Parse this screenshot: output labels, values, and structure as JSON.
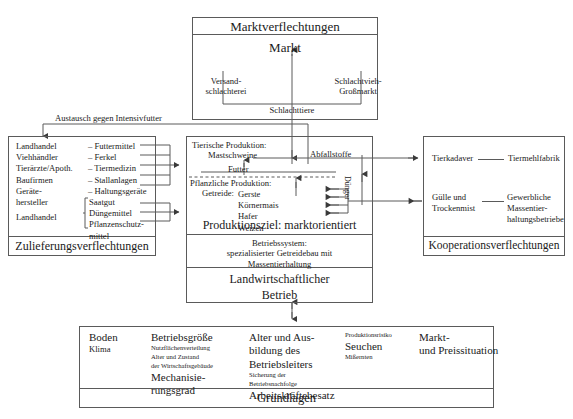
{
  "diagram": {
    "title_hidden": "Agrarbetrieb Verflechtungsdiagramm"
  },
  "market_panel": {
    "caption": "Marktverflechtungen",
    "center_label": "Markt",
    "left_node": "Versand-\nschlachterei",
    "left_node_line1": "Versand-",
    "left_node_line2": "schlachterei",
    "right_node_line1": "Schlachtvieh-",
    "right_node_line2": "Großmarkt",
    "flow_label": "Schlachttiere"
  },
  "supply_panel": {
    "caption": "Zulieferungsverflechtungen",
    "group_a": {
      "actors": [
        "Landhandel",
        "Viehhändler",
        "Tierärzte/Apoth.",
        "Baufirmen",
        "Geräte-",
        "hersteller"
      ],
      "goods": [
        "– Futtermittel",
        "– Ferkel",
        "– Tiermedizin",
        "– Stallanlagen",
        "– Haltungsgeräte"
      ]
    },
    "group_b": {
      "actors": [
        "Landhandel"
      ],
      "goods": [
        "Saatgut",
        "Düngemittel",
        "Pflanzenschutz-",
        "mittel"
      ]
    }
  },
  "farm_panel": {
    "animal_heading": "Tierische Produktion:",
    "animal_item": "Mastschweine",
    "feed_label": "Futter",
    "plant_heading": "Pflanzliche Produktion:",
    "plant_sub": "Getreide:",
    "crops": [
      "Gerste",
      "Körnermais",
      "Hafer",
      "Weizen"
    ],
    "goal_label": "Produktionsziel: marktorientiert",
    "system_lines": [
      "Betriebssystem:",
      "spezialisierter Getreidebau mit",
      "Massentierhaltung"
    ],
    "farm_title_line1": "Landwirtschaftlicher",
    "farm_title_line2": "Betrieb",
    "waste_label": "Abfallstoffe",
    "fertilizer_label": "Dünger"
  },
  "cooperation_panel": {
    "caption": "Kooperationsverflechtungen",
    "row1_left": "Tierkadaver",
    "row1_right": "Tiermehlfabrik",
    "row2_left_line1": "Gülle und",
    "row2_left_line2": "Trockenmist",
    "row2_right_line1": "Gewerbliche",
    "row2_right_line2": "Massentier-",
    "row2_right_line3": "haltungsbetriebe"
  },
  "exchange_label": "Austausch gegen Intensivfutter",
  "foundations_panel": {
    "caption": "Grundlagen",
    "columns": [
      {
        "items": [
          {
            "text": "Boden",
            "size": "med"
          },
          {
            "text": "Klima",
            "size": "sm"
          }
        ]
      },
      {
        "items": [
          {
            "text": "Betriebsgröße",
            "size": "med"
          },
          {
            "text": "Nutzflächenverteilung",
            "size": "xs"
          },
          {
            "text": "Alter und Zustand",
            "size": "xs"
          },
          {
            "text": "der Wirtschaftsgebäude",
            "size": "xs"
          },
          {
            "text": "Mechanisie-",
            "size": "med"
          },
          {
            "text": "rungsgrad",
            "size": "med"
          }
        ]
      },
      {
        "items": [
          {
            "text": "Alter und Aus-",
            "size": "med"
          },
          {
            "text": "bildung des",
            "size": "med"
          },
          {
            "text": "Betriebsleiters",
            "size": "med"
          },
          {
            "text": "Sicherung der",
            "size": "xs"
          },
          {
            "text": "Betriebsnachfolge",
            "size": "xs"
          },
          {
            "text": "Arbeitskräftebesatz",
            "size": "med"
          }
        ]
      },
      {
        "items": [
          {
            "text": "Produktionsrisiko",
            "size": "xs"
          },
          {
            "text": "Seuchen",
            "size": "med"
          },
          {
            "text": "Mißernten",
            "size": "xs"
          }
        ]
      },
      {
        "items": [
          {
            "text": "Markt-",
            "size": "med"
          },
          {
            "text": "und Preissituation",
            "size": "med"
          }
        ]
      }
    ]
  },
  "colors": {
    "line": "#5a5a5a",
    "text": "#1a1a1a",
    "background": "#ffffff"
  }
}
